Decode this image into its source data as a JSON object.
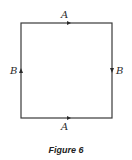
{
  "figure": {
    "caption": "Figure 6",
    "square": {
      "left": 21,
      "top": 23,
      "right": 112,
      "bottom": 118,
      "stroke_color": "#3a3a3a"
    },
    "edges": {
      "top": {
        "label": "A",
        "direction": "right"
      },
      "right": {
        "label": "B",
        "direction": "down"
      },
      "bottom": {
        "label": "A",
        "direction": "right"
      },
      "left": {
        "label": "B",
        "direction": "up"
      }
    }
  }
}
